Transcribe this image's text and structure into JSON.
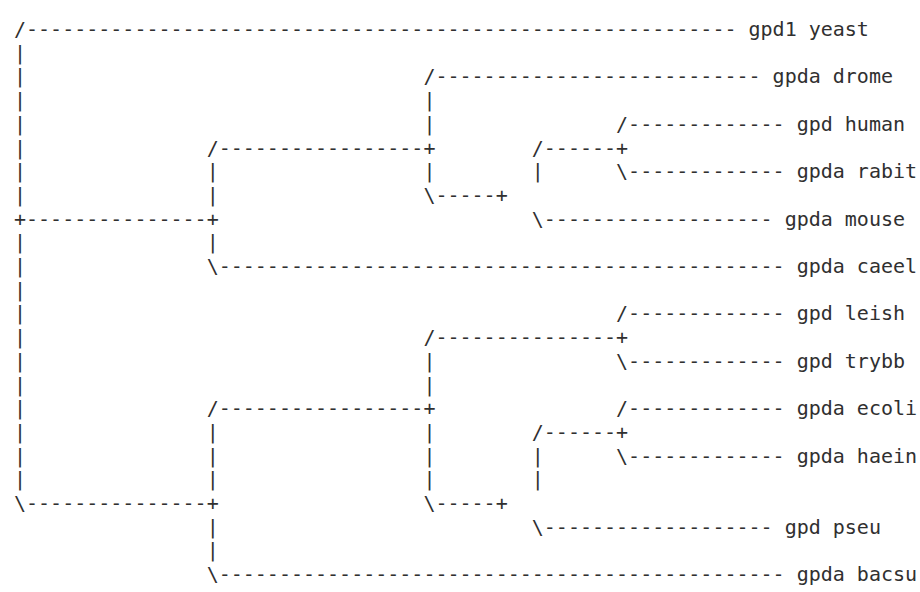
{
  "canvas": {
    "width": 920,
    "height": 592,
    "background": "#ffffff",
    "text_color": "#303030"
  },
  "figure": {
    "type": "ascii-phylogenetic-tree",
    "taxa_count": 12,
    "branch_characters": [
      "/",
      "\\",
      "+",
      "|",
      "-"
    ]
  },
  "taxa": [
    {
      "index": 0,
      "label": "gpd1 yeast",
      "row": 0
    },
    {
      "index": 1,
      "label": "gpda drome",
      "row": 2
    },
    {
      "index": 2,
      "label": "gpd human",
      "row": 4
    },
    {
      "index": 3,
      "label": "gpda rabit",
      "row": 6
    },
    {
      "index": 4,
      "label": "gpda mouse",
      "row": 8
    },
    {
      "index": 5,
      "label": "gpda caeel",
      "row": 10
    },
    {
      "index": 6,
      "label": "gpd leish",
      "row": 12
    },
    {
      "index": 7,
      "label": "gpd trybb",
      "row": 14
    },
    {
      "index": 8,
      "label": "gpda ecoli",
      "row": 16
    },
    {
      "index": 9,
      "label": "gpda haein",
      "row": 18
    },
    {
      "index": 10,
      "label": "gpd pseu",
      "row": 20
    },
    {
      "index": 11,
      "label": "gpda bacsu",
      "row": 22
    }
  ],
  "ascii_rows": [
    "/----------------------------------------------------------- gpd1 yeast",
    "|",
    "|                                 /--------------------------- gpda drome",
    "|                                 |",
    "|                                 |               /------------- gpd human",
    "|               /-----------------+        /------+",
    "|               |                 |        |      \\------------- gpda rabit",
    "|               |                 \\-----+",
    "+---------------+                          \\------------------- gpda mouse",
    "|               |",
    "|               \\----------------------------------------------- gpda caeel",
    "|",
    "|                                                 /------------- gpd leish",
    "|                                 /---------------+",
    "|                                 |               \\------------- gpd trybb",
    "|                                 |",
    "|               /-----------------+               /------------- gpda ecoli",
    "|               |                 |        /------+",
    "|               |                 |        |      \\------------- gpda haein",
    "|               |                 |        |",
    "\\---------------+                 \\-----+",
    "                |                          \\------------------- gpd pseu",
    "                |",
    "                \\----------------------------------------------- gpda bacsu"
  ],
  "tree_topology": {
    "root": "+",
    "children": [
      {
        "name": "gpd1 yeast",
        "leaf": true
      },
      {
        "name": "eukaryote-clade",
        "leaf": false,
        "children": [
          {
            "name": "drome-vertebrate-clade",
            "leaf": false,
            "children": [
              {
                "name": "gpda drome",
                "leaf": true
              },
              {
                "name": "vertebrate-clade",
                "leaf": false,
                "children": [
                  {
                    "name": "human-rabit-clade",
                    "leaf": false,
                    "children": [
                      {
                        "name": "gpd human",
                        "leaf": true
                      },
                      {
                        "name": "gpda rabit",
                        "leaf": true
                      }
                    ]
                  },
                  {
                    "name": "gpda mouse",
                    "leaf": true
                  }
                ]
              }
            ]
          },
          {
            "name": "gpda caeel",
            "leaf": true
          }
        ]
      },
      {
        "name": "protist-bacteria-clade",
        "leaf": false,
        "children": [
          {
            "name": "trypanosomatid-bacteria-clade",
            "leaf": false,
            "children": [
              {
                "name": "trypanosomatid-clade",
                "leaf": false,
                "children": [
                  {
                    "name": "gpd leish",
                    "leaf": true
                  },
                  {
                    "name": "gpd trybb",
                    "leaf": true
                  }
                ]
              },
              {
                "name": "bacteria-clade",
                "leaf": false,
                "children": [
                  {
                    "name": "enterobacteria-clade",
                    "leaf": false,
                    "children": [
                      {
                        "name": "gpda ecoli",
                        "leaf": true
                      },
                      {
                        "name": "gpda haein",
                        "leaf": true
                      }
                    ]
                  },
                  {
                    "name": "gpd pseu",
                    "leaf": true
                  }
                ]
              }
            ]
          },
          {
            "name": "gpda bacsu",
            "leaf": true
          }
        ]
      }
    ]
  }
}
